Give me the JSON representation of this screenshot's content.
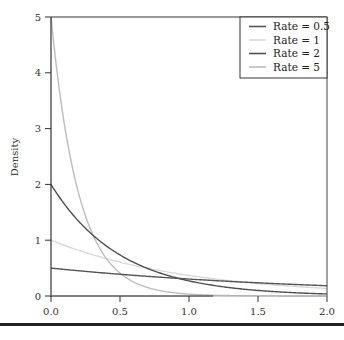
{
  "chart_data": {
    "type": "line",
    "title": "",
    "xlabel": "",
    "ylabel": "Density",
    "xlim": [
      0,
      2
    ],
    "ylim": [
      0,
      5
    ],
    "x_ticks": [
      "0.0",
      "0.5",
      "1.0",
      "1.5",
      "2.0"
    ],
    "y_ticks": [
      "0",
      "1",
      "2",
      "3",
      "4",
      "5"
    ],
    "grid": false,
    "legend_position": "top-right",
    "function": "rate * exp(-rate * x)",
    "series": [
      {
        "name": "Rate = 0.5",
        "rate": 0.5,
        "color": "#555555",
        "x": [
          0,
          0.5,
          1.0,
          1.5,
          2.0
        ],
        "values": [
          0.5,
          0.39,
          0.3,
          0.24,
          0.18
        ]
      },
      {
        "name": "Rate = 1",
        "rate": 1,
        "color": "#d9d9d9",
        "x": [
          0,
          0.5,
          1.0,
          1.5,
          2.0
        ],
        "values": [
          1.0,
          0.61,
          0.37,
          0.22,
          0.14
        ]
      },
      {
        "name": "Rate = 2",
        "rate": 2,
        "color": "#505050",
        "x": [
          0,
          0.5,
          1.0,
          1.5,
          2.0
        ],
        "values": [
          2.0,
          0.74,
          0.27,
          0.1,
          0.04
        ]
      },
      {
        "name": "Rate = 5",
        "rate": 5,
        "color": "#bdbdbd",
        "x": [
          0,
          0.5,
          1.0,
          1.5,
          2.0
        ],
        "values": [
          5.0,
          0.41,
          0.03,
          0.003,
          0.0002
        ]
      }
    ]
  },
  "legend": {
    "items": [
      {
        "label": "Rate = 0.5",
        "color": "#555555"
      },
      {
        "label": "Rate = 1",
        "color": "#d9d9d9"
      },
      {
        "label": "Rate = 2",
        "color": "#505050"
      },
      {
        "label": "Rate = 5",
        "color": "#bdbdbd"
      }
    ]
  },
  "axes": {
    "ylabel": "Density",
    "x_ticks": [
      "0.0",
      "0.5",
      "1.0",
      "1.5",
      "2.0"
    ],
    "y_ticks": [
      "0",
      "1",
      "2",
      "3",
      "4",
      "5"
    ]
  }
}
